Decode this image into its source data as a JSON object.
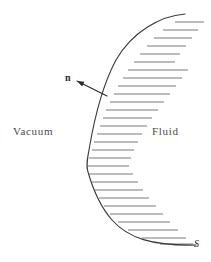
{
  "figure": {
    "type": "physics-diagram",
    "background_color": "#ffffff",
    "width": 211,
    "height": 262
  },
  "labels": {
    "vacuum": "Vacuum",
    "fluid": "Fluid",
    "normal_vector": "n",
    "surface": "S"
  },
  "colors": {
    "curve": "#3a3a3a",
    "hatching": "#6b6b6b",
    "arrow": "#2b2b2b",
    "text_region": "#4a4a4a",
    "text_symbol": "#2b2b2b"
  },
  "chart_data": {
    "type": "line",
    "xlabel": "",
    "ylabel": "",
    "grid": false,
    "legend": null,
    "annotations": [
      {
        "text": "Vacuum",
        "x": 13,
        "y": 131,
        "role": "region-label",
        "side": "left"
      },
      {
        "text": "Fluid",
        "x": 152,
        "y": 131,
        "role": "region-label",
        "side": "right"
      },
      {
        "text": "n",
        "x": 67,
        "y": 78,
        "role": "vector-label",
        "style": "bold"
      },
      {
        "text": "S",
        "x": 196,
        "y": 243,
        "role": "surface-label",
        "style": "italic"
      }
    ],
    "series": [
      {
        "name": "interface-curve",
        "description": "Boundary surface S separating vacuum (left) from fluid (right)",
        "path": "M 185 14 C 160 16, 132 32, 116 60 C 102 86, 94 120, 89 150 C 87 160, 86 166, 88 172 C 92 186, 98 204, 112 220 C 128 238, 152 246, 196 245"
      },
      {
        "name": "normal-arrow",
        "description": "Outward unit normal n pointing from surface into vacuum",
        "tail_x": 107,
        "tail_y": 96,
        "tip_x": 77,
        "tip_y": 81
      }
    ],
    "hatching": {
      "orientation": "horizontal",
      "side": "fluid",
      "spacing": 8,
      "count": 29,
      "lines": [
        {
          "y": 22,
          "x1": 175,
          "x2": 204
        },
        {
          "y": 30,
          "x1": 163,
          "x2": 198
        },
        {
          "y": 38,
          "x1": 154,
          "x2": 192
        },
        {
          "y": 46,
          "x1": 147,
          "x2": 186
        },
        {
          "y": 54,
          "x1": 140,
          "x2": 180
        },
        {
          "y": 62,
          "x1": 134,
          "x2": 175
        },
        {
          "y": 70,
          "x1": 128,
          "x2": 188
        },
        {
          "y": 78,
          "x1": 123,
          "x2": 182
        },
        {
          "y": 86,
          "x1": 118,
          "x2": 176
        },
        {
          "y": 94,
          "x1": 114,
          "x2": 170
        },
        {
          "y": 102,
          "x1": 110,
          "x2": 164
        },
        {
          "y": 110,
          "x1": 106,
          "x2": 158
        },
        {
          "y": 118,
          "x1": 103,
          "x2": 152
        },
        {
          "y": 126,
          "x1": 100,
          "x2": 147
        },
        {
          "y": 134,
          "x1": 97,
          "x2": 142
        },
        {
          "y": 142,
          "x1": 94,
          "x2": 138
        },
        {
          "y": 150,
          "x1": 92,
          "x2": 134
        },
        {
          "y": 158,
          "x1": 89,
          "x2": 131
        },
        {
          "y": 166,
          "x1": 88,
          "x2": 129
        },
        {
          "y": 174,
          "x1": 89,
          "x2": 133
        },
        {
          "y": 182,
          "x1": 92,
          "x2": 138
        },
        {
          "y": 190,
          "x1": 95,
          "x2": 143
        },
        {
          "y": 198,
          "x1": 99,
          "x2": 149
        },
        {
          "y": 206,
          "x1": 104,
          "x2": 156
        },
        {
          "y": 214,
          "x1": 110,
          "x2": 163
        },
        {
          "y": 222,
          "x1": 118,
          "x2": 170
        },
        {
          "y": 230,
          "x1": 128,
          "x2": 178
        },
        {
          "y": 238,
          "x1": 142,
          "x2": 186
        },
        {
          "y": 244,
          "x1": 160,
          "x2": 193
        }
      ]
    }
  }
}
